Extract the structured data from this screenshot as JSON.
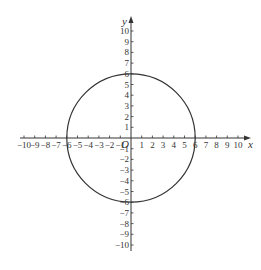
{
  "chart_data": {
    "type": "line",
    "title": "",
    "xlabel": "x",
    "ylabel": "y",
    "origin_label": "O",
    "xlim": [
      -10,
      10
    ],
    "ylim": [
      -10,
      10
    ],
    "grid": false,
    "x_ticks": [
      -10,
      -9,
      -8,
      -7,
      -6,
      -5,
      -4,
      -3,
      -2,
      -1,
      1,
      2,
      3,
      4,
      5,
      6,
      7,
      8,
      9,
      10
    ],
    "y_ticks": [
      -10,
      -9,
      -8,
      -7,
      -6,
      -5,
      -4,
      -3,
      -2,
      -1,
      1,
      2,
      3,
      4,
      5,
      6,
      7,
      8,
      9,
      10
    ],
    "series": [
      {
        "name": "circle",
        "shape": "circle",
        "equation": "x^2 + y^2 = 36",
        "center": [
          0,
          0
        ],
        "radius": 6,
        "color": "#333333"
      }
    ]
  },
  "layout": {
    "origin_px": [
      131,
      138
    ],
    "unit_px": 10.7,
    "axis_color": "#333333"
  }
}
